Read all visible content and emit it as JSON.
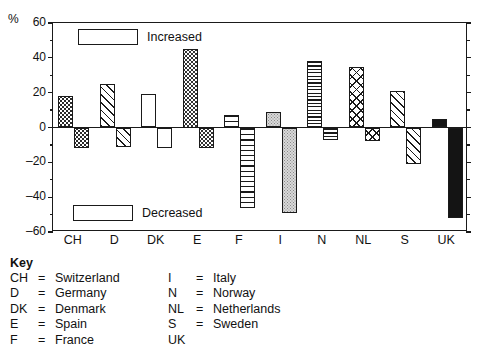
{
  "axis": {
    "unit_label": "%",
    "ylabels": [
      "60",
      "40",
      "20",
      "0",
      "-20",
      "-40",
      "-60"
    ],
    "ymin": -60,
    "ymax": 60
  },
  "legend": {
    "increased": "Increased",
    "decreased": "Decreased"
  },
  "key": {
    "title": "Key",
    "col1": [
      {
        "abbr": "CH",
        "eq": "=",
        "name": "Switzerland"
      },
      {
        "abbr": "D",
        "eq": "=",
        "name": "Germany"
      },
      {
        "abbr": "DK",
        "eq": "=",
        "name": "Denmark"
      },
      {
        "abbr": "E",
        "eq": "=",
        "name": "Spain"
      },
      {
        "abbr": "F",
        "eq": "=",
        "name": "France"
      }
    ],
    "col2": [
      {
        "abbr": "I",
        "eq": "=",
        "name": "Italy"
      },
      {
        "abbr": "N",
        "eq": "=",
        "name": "Norway"
      },
      {
        "abbr": "NL",
        "eq": "=",
        "name": "Netherlands"
      },
      {
        "abbr": "S",
        "eq": "=",
        "name": "Sweden"
      },
      {
        "abbr": "UK",
        "eq": "",
        "name": ""
      }
    ]
  },
  "chart_data": {
    "type": "bar",
    "title": "",
    "xlabel": "",
    "ylabel": "%",
    "ylim": [
      -60,
      60
    ],
    "ytick_step": 20,
    "yminor_step": 10,
    "grid": false,
    "legend_position": "inside-top-left / inside-bottom-left",
    "categories": [
      "CH",
      "D",
      "DK",
      "E",
      "F",
      "I",
      "N",
      "NL",
      "S",
      "UK"
    ],
    "series": [
      {
        "name": "Increased",
        "values": [
          18,
          25,
          19,
          45,
          7,
          9,
          38,
          35,
          21,
          5
        ]
      },
      {
        "name": "Decreased",
        "values": [
          -12,
          -11,
          -12,
          -12,
          -46,
          -49,
          -7,
          -8,
          -21,
          -52
        ]
      }
    ],
    "bar_patterns": [
      "dot-dark",
      "diagonal",
      "blank",
      "dot-light",
      "horizontal",
      "stipple",
      "horizontal-dense",
      "crosshatch",
      "diagonal",
      "solid"
    ]
  }
}
